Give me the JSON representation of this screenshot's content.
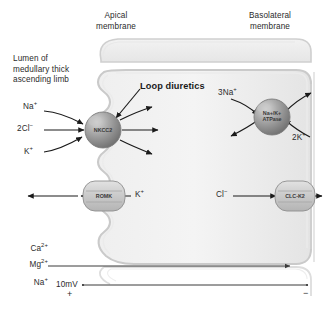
{
  "figure": {
    "background_color": "#ffffff",
    "text_color": "#2b2b2b"
  },
  "headings": {
    "apical_line1": "Apical",
    "apical_line2": "membrane",
    "basolateral_line1": "Basolateral",
    "basolateral_line2": "membrane"
  },
  "lumen_label": {
    "line1": "Lumen of",
    "line2": "medullary thick",
    "line3": "ascending limb"
  },
  "annotation": {
    "loop_diuretics": "Loop diuretics"
  },
  "transporters": [
    {
      "id": "nkcc2",
      "name": "NKCC2",
      "shape": "sphere",
      "membrane": "apical",
      "fill_color": "#9a9a9a"
    },
    {
      "id": "romk",
      "name": "ROMK",
      "shape": "channel",
      "membrane": "apical",
      "fill_color": "#cfcfcf"
    },
    {
      "id": "nak-atpase",
      "name_line1": "Na+/K+",
      "name_line2": "ATPase",
      "shape": "sphere",
      "membrane": "basolateral",
      "fill_color": "#9a9a9a"
    },
    {
      "id": "clc-k2",
      "name": "CLC-K2",
      "shape": "channel",
      "membrane": "basolateral",
      "fill_color": "#cfcfcf"
    }
  ],
  "ion_labels": {
    "nkcc2_sodium": "Na",
    "nkcc2_sodium_charge": "+",
    "nkcc2_chloride": "2Cl",
    "nkcc2_chloride_charge": "−",
    "nkcc2_potassium": "K",
    "nkcc2_potassium_charge": "+",
    "romk_potassium": "K",
    "romk_potassium_charge": "+",
    "atpase_sodium": "3Na",
    "atpase_sodium_charge": "+",
    "atpase_potassium": "2K",
    "atpase_potassium_charge": "+",
    "clck2_chloride": "Cl",
    "clck2_chloride_charge": "−"
  },
  "paracellular": {
    "calcium": "Ca",
    "calcium_charge": "2+",
    "magnesium": "Mg",
    "magnesium_charge": "2+",
    "sodium": "Na",
    "sodium_charge": "+",
    "voltage": "10mV",
    "polarity_lumen": "+",
    "polarity_blood": "−"
  }
}
